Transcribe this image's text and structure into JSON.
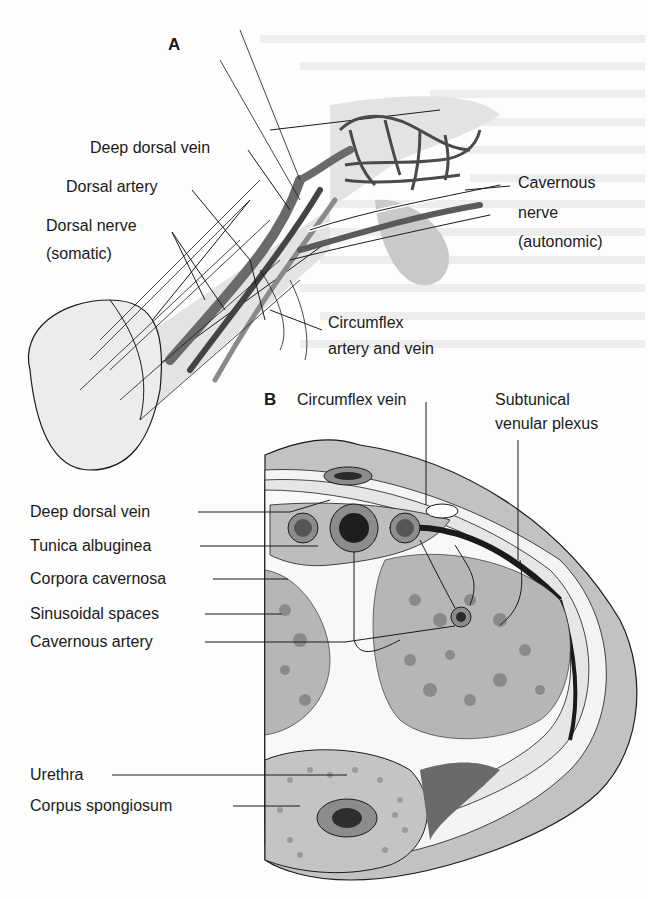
{
  "figure": {
    "panel_a": {
      "letter": "A",
      "labels": {
        "deep_dorsal_vein": "Deep dorsal vein",
        "dorsal_artery": "Dorsal artery",
        "dorsal_nerve_1": "Dorsal nerve",
        "dorsal_nerve_2": "(somatic)",
        "cavernous_nerve_1": "Cavernous",
        "cavernous_nerve_2": "nerve",
        "cavernous_nerve_3": "(autonomic)",
        "circumflex_av_1": "Circumflex",
        "circumflex_av_2": "artery and vein"
      }
    },
    "panel_b": {
      "letter": "B",
      "labels": {
        "circumflex_vein": "Circumflex vein",
        "subtunical_1": "Subtunical",
        "subtunical_2": "venular plexus",
        "deep_dorsal_vein": "Deep dorsal vein",
        "tunica_albuginea": "Tunica albuginea",
        "corpora_cavernosa": "Corpora cavernosa",
        "sinusoidal_spaces": "Sinusoidal spaces",
        "cavernous_artery": "Cavernous artery",
        "urethra": "Urethra",
        "corpus_spongiosum": "Corpus spongiosum"
      }
    },
    "colors": {
      "background": "#fdfdfd",
      "light_gray": "#d9d9d9",
      "mid_gray": "#a8a8a8",
      "dark_gray": "#6a6a6a",
      "vessel_dark": "#2a2a2a",
      "line": "#1a1a1a"
    }
  }
}
